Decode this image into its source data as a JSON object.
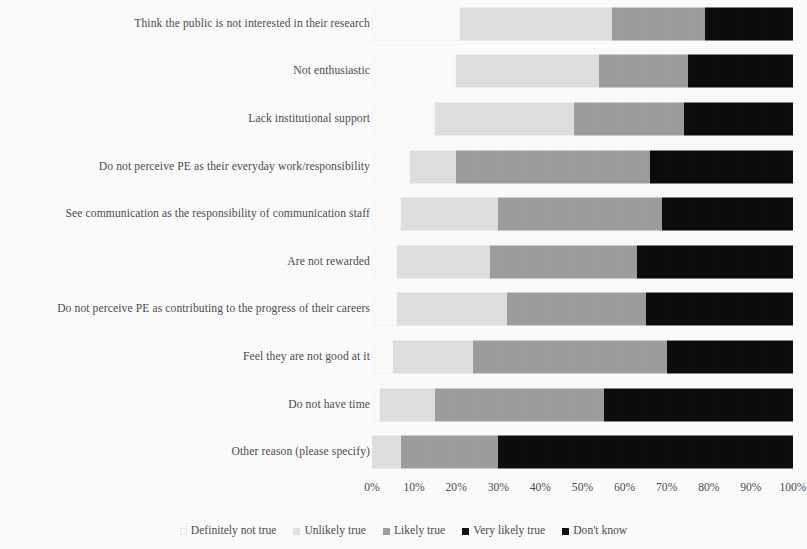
{
  "chart_data": {
    "type": "bar",
    "subtype": "stacked-horizontal-100",
    "title": "",
    "xlabel": "",
    "ylabel": "",
    "xlim": [
      0,
      100
    ],
    "grid": false,
    "legend_position": "bottom",
    "x_tick_labels": [
      "0%",
      "10%",
      "20%",
      "30%",
      "40%",
      "50%",
      "60%",
      "70%",
      "80%",
      "90%",
      "100%"
    ],
    "x_ticks": [
      0,
      10,
      20,
      30,
      40,
      50,
      60,
      70,
      80,
      90,
      100
    ],
    "categories": [
      "Think the public is not interested in their research",
      "Not enthusiastic",
      "Lack institutional support",
      "Do not perceive PE as their everyday work/responsibility",
      "See communication as the responsibility of communication staff",
      "Are not rewarded",
      "Do not perceive PE as contributing to the progress of their careers",
      "Feel they are not good at it",
      "Do not have time",
      "Other reason (please specify)"
    ],
    "series": [
      {
        "name": "Definitely not true",
        "color": "#ffffff",
        "values": [
          21,
          20,
          15,
          9,
          7,
          6,
          6,
          5,
          2,
          0
        ]
      },
      {
        "name": "Unlikely true",
        "color": "#e0e0e0",
        "values": [
          36,
          34,
          33,
          11,
          23,
          22,
          26,
          19,
          13,
          7
        ]
      },
      {
        "name": "Likely true",
        "color": "#9e9e9e",
        "values": [
          22,
          21,
          26,
          46,
          39,
          35,
          33,
          46,
          40,
          23
        ]
      },
      {
        "name": "Very likely true",
        "color": "#0d0d0d",
        "values": [
          21,
          25,
          26,
          34,
          31,
          37,
          35,
          30,
          45,
          70
        ]
      },
      {
        "name": "Don't know",
        "color": "#0d0d0d",
        "values": [
          0,
          0,
          0,
          0,
          0,
          0,
          0,
          0,
          0,
          0
        ]
      }
    ]
  },
  "legend": {
    "items": [
      {
        "label": "Definitely not true",
        "color": "#fbfbfb"
      },
      {
        "label": "Unlikely true",
        "color": "#e3e3e3"
      },
      {
        "label": "Likely true",
        "color": "#9e9e9e"
      },
      {
        "label": "Very likely true",
        "color": "#121212"
      },
      {
        "label": "Don't know",
        "color": "#121212"
      }
    ]
  }
}
